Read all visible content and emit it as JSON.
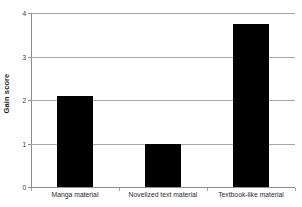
{
  "chart_data": {
    "type": "bar",
    "title": "",
    "subtitle": "",
    "xlabel": "",
    "ylabel": "Gain score",
    "categories": [
      "Manga material",
      "Novelized text material",
      "Textbook-like material"
    ],
    "values": [
      2.1,
      1.0,
      3.75
    ],
    "series": [
      {
        "name": "Gain score",
        "values": [
          2.1,
          1.0,
          3.75
        ],
        "color": "#000000"
      }
    ],
    "ylim": [
      0,
      4
    ],
    "yticks": [
      "0",
      "1",
      "2",
      "3",
      "4"
    ],
    "ytick_values": [
      0,
      1,
      2,
      3,
      4
    ],
    "grid": "horizontal",
    "legend": "none",
    "bar_color": "#000000",
    "gridline_color": "#a6a6a6",
    "axis_color": "#8c8c8c",
    "background": "#ffffff"
  }
}
